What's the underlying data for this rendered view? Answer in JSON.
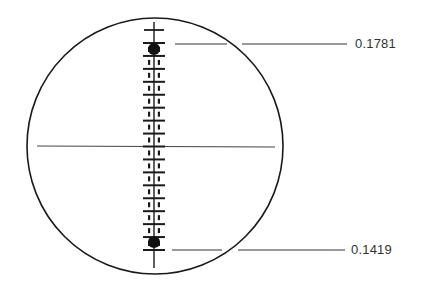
{
  "diagram": {
    "type": "microscope reticle scale view",
    "circle": {
      "cx": 155,
      "cy": 146,
      "r": 128
    },
    "crosshair_y": 146,
    "scale_x": 154,
    "readings": [
      {
        "id": "top",
        "label": "0.1781",
        "y": 44
      },
      {
        "id": "bottom",
        "label": "0.1419",
        "y": 250
      }
    ],
    "colors": {
      "line": "#1a1a1a",
      "text": "#333333",
      "background": "#ffffff"
    }
  }
}
